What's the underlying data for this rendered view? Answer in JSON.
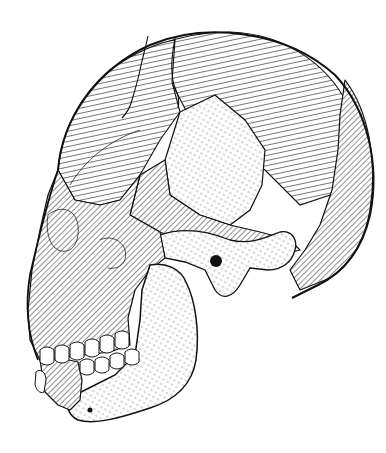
{
  "figure": {
    "view": "left lateral",
    "style": "pen-and-ink hatching",
    "colors": {
      "background": "#ffffff",
      "ink": "#111111"
    },
    "regions": [
      {
        "name": "frontal-bone",
        "shading": "curved-lines"
      },
      {
        "name": "parietal-bone",
        "shading": "curved-lines"
      },
      {
        "name": "occipital-bone",
        "shading": "diagonal-hatch"
      },
      {
        "name": "temporal-bone",
        "shading": "stipple"
      },
      {
        "name": "sphenoid-wing",
        "shading": "stipple"
      },
      {
        "name": "zygomatic-arch",
        "shading": "stipple"
      },
      {
        "name": "maxilla",
        "shading": "diagonal-hatch"
      },
      {
        "name": "orbit",
        "shading": "diagonal-hatch"
      },
      {
        "name": "mandible",
        "shading": "stipple"
      },
      {
        "name": "upper-teeth",
        "shading": "outline"
      },
      {
        "name": "lower-teeth",
        "shading": "outline"
      },
      {
        "name": "external-auditory-meatus",
        "shading": "solid"
      },
      {
        "name": "mental-foramen",
        "shading": "solid"
      }
    ],
    "outline": {
      "cranium": "M60,150 C70,100 110,55 170,38 C230,22 300,40 340,95 C370,135 378,190 362,240 C350,275 320,290 290,298 L270,290",
      "face": "M60,150 C45,190 30,240 25,280 C22,300 28,330 40,355"
    }
  }
}
